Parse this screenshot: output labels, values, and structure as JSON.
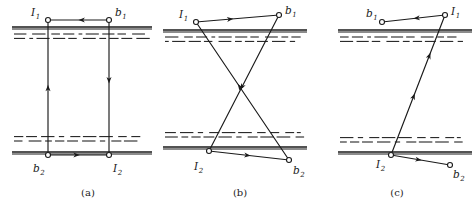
{
  "figure": {
    "kind": "ray-path-diagram",
    "panel_count": 3,
    "line_color": "#1a1a1a",
    "background_color": "#ffffff",
    "panels": [
      {
        "id": "a",
        "caption": "(a)",
        "caption_x": 88,
        "caption_y": 196,
        "nodes": [
          {
            "name": "I1",
            "base": "I",
            "sub": "1",
            "x": 48,
            "y": 20,
            "label_x": 31,
            "label_y": 16,
            "sub_dx": 7,
            "sub_dy": 3
          },
          {
            "name": "b1",
            "base": "b",
            "sub": "1",
            "x": 109,
            "y": 20,
            "label_x": 115,
            "label_y": 16,
            "sub_dx": 6,
            "sub_dy": 3
          },
          {
            "name": "b2",
            "base": "b",
            "sub": "2",
            "x": 48,
            "y": 155,
            "label_x": 33,
            "label_y": 172,
            "sub_dx": 6,
            "sub_dy": 3
          },
          {
            "name": "I2",
            "base": "I",
            "sub": "2",
            "x": 109,
            "y": 155,
            "label_x": 113,
            "label_y": 172,
            "sub_dx": 7,
            "sub_dy": 3
          }
        ],
        "segments": [
          {
            "name": "top-link",
            "x1": 109,
            "y1": 20,
            "x2": 48,
            "y2": 20,
            "arrow_t": 0.5
          },
          {
            "name": "left-riser",
            "x1": 48,
            "y1": 155,
            "x2": 48,
            "y2": 20,
            "arrow_t": 0.52
          },
          {
            "name": "right-riser",
            "x1": 109,
            "y1": 20,
            "x2": 109,
            "y2": 155,
            "arrow_t": 0.47
          },
          {
            "name": "bottom-link",
            "x1": 48,
            "y1": 155,
            "x2": 109,
            "y2": 155,
            "arrow_t": 0.52
          }
        ],
        "bands": [
          {
            "name": "upper-boundary",
            "y": 27,
            "x_left": 12,
            "x_right": 152,
            "dash_y": 34,
            "side": "below"
          },
          {
            "name": "lower-boundary",
            "y": 152,
            "x_left": 12,
            "x_right": 152,
            "dash_y": 141,
            "side": "above"
          }
        ]
      },
      {
        "id": "b",
        "caption": "(b)",
        "caption_x": 240,
        "caption_y": 196,
        "nodes": [
          {
            "name": "I1",
            "base": "I",
            "sub": "1",
            "x": 196,
            "y": 22,
            "label_x": 179,
            "label_y": 18,
            "sub_dx": 7,
            "sub_dy": 3
          },
          {
            "name": "b1",
            "base": "b",
            "sub": "1",
            "x": 279,
            "y": 15,
            "label_x": 285,
            "label_y": 14,
            "sub_dx": 6,
            "sub_dy": 3
          },
          {
            "name": "I2",
            "base": "I",
            "sub": "2",
            "x": 209,
            "y": 151,
            "label_x": 194,
            "label_y": 170,
            "sub_dx": 7,
            "sub_dy": 3
          },
          {
            "name": "b2",
            "base": "b",
            "sub": "2",
            "x": 289,
            "y": 160,
            "label_x": 293,
            "label_y": 174,
            "sub_dx": 6,
            "sub_dy": 3
          }
        ],
        "segments": [
          {
            "name": "top-link",
            "x1": 196,
            "y1": 22,
            "x2": 279,
            "y2": 15,
            "arrow_t": 0.45
          },
          {
            "name": "cross-rising",
            "x1": 289,
            "y1": 160,
            "x2": 196,
            "y2": 22,
            "arrow_t": 0.55
          },
          {
            "name": "cross-falling",
            "x1": 279,
            "y1": 15,
            "x2": 209,
            "y2": 151,
            "arrow_t": 0.55
          },
          {
            "name": "bottom-link",
            "x1": 209,
            "y1": 151,
            "x2": 289,
            "y2": 160,
            "arrow_t": 0.52
          }
        ],
        "bands": [
          {
            "name": "upper-boundary",
            "y": 30,
            "x_left": 163,
            "x_right": 307,
            "dash_y": 37,
            "side": "below"
          },
          {
            "name": "lower-boundary",
            "y": 147,
            "x_left": 163,
            "x_right": 307,
            "dash_y": 137,
            "side": "above"
          }
        ]
      },
      {
        "id": "c",
        "caption": "(c)",
        "caption_x": 397,
        "caption_y": 196,
        "nodes": [
          {
            "name": "b1",
            "base": "b",
            "sub": "1",
            "x": 382,
            "y": 22,
            "label_x": 366,
            "label_y": 17,
            "sub_dx": 6,
            "sub_dy": 3
          },
          {
            "name": "I1",
            "base": "I",
            "sub": "1",
            "x": 445,
            "y": 15,
            "label_x": 451,
            "label_y": 15,
            "sub_dx": 7,
            "sub_dy": 3
          },
          {
            "name": "I2",
            "base": "I",
            "sub": "2",
            "x": 391,
            "y": 155,
            "label_x": 376,
            "label_y": 168,
            "sub_dx": 7,
            "sub_dy": 3
          },
          {
            "name": "b2",
            "base": "b",
            "sub": "2",
            "x": 450,
            "y": 165,
            "label_x": 453,
            "label_y": 178,
            "sub_dx": 6,
            "sub_dy": 3
          }
        ],
        "segments": [
          {
            "name": "top-link",
            "x1": 445,
            "y1": 15,
            "x2": 382,
            "y2": 22,
            "arrow_t": 0.5
          },
          {
            "name": "slant-riser",
            "x1": 391,
            "y1": 155,
            "x2": 445,
            "y2": 15,
            "arrow_t": 0.44
          },
          {
            "name": "slant-mid",
            "x1": 391,
            "y1": 155,
            "x2": 445,
            "y2": 15,
            "arrow_t": 0.73
          },
          {
            "name": "bottom-link",
            "x1": 391,
            "y1": 155,
            "x2": 450,
            "y2": 165,
            "arrow_t": 0.52
          }
        ],
        "bands": [
          {
            "name": "upper-boundary",
            "y": 30,
            "x_left": 338,
            "x_right": 472,
            "dash_y": 37,
            "side": "below"
          },
          {
            "name": "lower-boundary",
            "y": 152,
            "x_left": 338,
            "x_right": 472,
            "dash_y": 142,
            "side": "above"
          }
        ]
      }
    ]
  }
}
